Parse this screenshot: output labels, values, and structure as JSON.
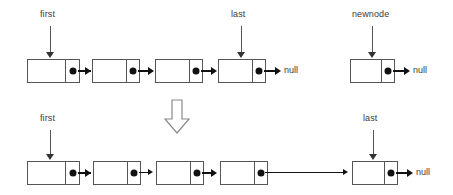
{
  "diagram": {
    "colors": {
      "stroke": "#555555",
      "fill": "#ffffff",
      "dot": "#111111",
      "text": "#3a3a3a",
      "background": "#ffffff"
    },
    "before": {
      "labels": {
        "first": "first",
        "last": "last",
        "newnode": "newnode"
      },
      "nulls": {
        "list_tail_null": "null",
        "newnode_null": "null"
      },
      "nodes": [
        {
          "id": "b-node-1",
          "pointed_by": "first",
          "value": ""
        },
        {
          "id": "b-node-2",
          "pointed_by": "",
          "value": ""
        },
        {
          "id": "b-node-3",
          "pointed_by": "",
          "value": ""
        },
        {
          "id": "b-node-4",
          "pointed_by": "last",
          "value": ""
        },
        {
          "id": "b-newnode",
          "pointed_by": "newnode",
          "value": ""
        }
      ]
    },
    "transition": {
      "glyph": "down-arrow"
    },
    "after": {
      "labels": {
        "first": "first",
        "last": "last"
      },
      "nulls": {
        "list_tail_null": "null"
      },
      "nodes": [
        {
          "id": "a-node-1",
          "pointed_by": "first",
          "value": ""
        },
        {
          "id": "a-node-2",
          "pointed_by": "",
          "value": ""
        },
        {
          "id": "a-node-3",
          "pointed_by": "",
          "value": ""
        },
        {
          "id": "a-node-4",
          "pointed_by": "",
          "value": ""
        },
        {
          "id": "a-node-5",
          "pointed_by": "last",
          "value": ""
        }
      ]
    }
  }
}
